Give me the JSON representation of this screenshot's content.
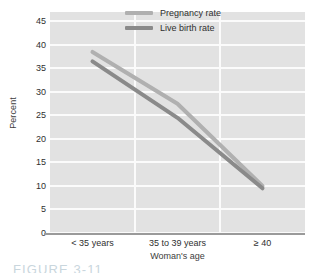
{
  "figure": {
    "caption": "FIGURE 3-11"
  },
  "chart_data": {
    "type": "line",
    "title": "",
    "xlabel": "Woman's age",
    "ylabel": "Percent",
    "categories": [
      "< 35 years",
      "35 to 39 years",
      "≥ 40"
    ],
    "ylim": [
      0,
      47
    ],
    "yticks": [
      0,
      5,
      10,
      15,
      20,
      25,
      30,
      35,
      40,
      45
    ],
    "ytick_labels": [
      "0",
      "5",
      "10",
      "15",
      "20",
      "25",
      "30",
      "35",
      "40",
      "45"
    ],
    "grid": "horizontal-and-vertical",
    "legend_position": "top-right-inside",
    "series": [
      {
        "name": "Pregnancy rate",
        "values": [
          38.5,
          27.5,
          10.0
        ],
        "color": "#b0b0b0"
      },
      {
        "name": "Live birth rate",
        "values": [
          36.5,
          24.5,
          9.5
        ],
        "color": "#8a8a8a"
      }
    ]
  },
  "colors": {
    "plot_background": "#e2e2e2",
    "gridline": "#fbfbfb",
    "axis_line": "#9a9a9a",
    "text": "#2f2f2f",
    "page_background": "#ffffff"
  }
}
